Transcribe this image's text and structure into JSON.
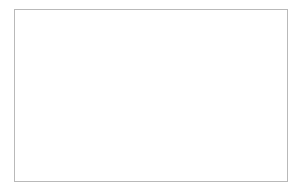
{
  "figure": {
    "kind": "stratigraphic-cross-section",
    "background_color": "#ffffff",
    "frame": {
      "name": "section-frame",
      "stroke_color": "#b9b9b9",
      "stroke_width": 1,
      "x": 14,
      "y": 9,
      "width": 274,
      "height": 173
    }
  },
  "chart_data": {
    "type": "line",
    "subtitle": "Folded strata beneath an erosional surface",
    "xlabel": "",
    "ylabel": "",
    "xlim": [
      14,
      288
    ],
    "ylim": [
      9,
      182
    ],
    "grid": false,
    "legend": null,
    "annotations": [],
    "series": [
      {
        "name": "erosional-top-surface",
        "role": "unconformity",
        "stroke_color": "#111111",
        "stroke_width": 2.6,
        "points": [
          [
            14,
            19
          ],
          [
            34,
            18.4
          ],
          [
            56,
            18.2
          ],
          [
            78,
            19.0
          ],
          [
            96,
            20.4
          ],
          [
            112,
            22.6
          ],
          [
            126,
            25.4
          ],
          [
            140,
            28.2
          ],
          [
            152,
            30.4
          ],
          [
            162,
            31.6
          ],
          [
            172,
            31.9
          ],
          [
            182,
            31.2
          ],
          [
            194,
            29.4
          ],
          [
            208,
            26.8
          ],
          [
            222,
            24.2
          ],
          [
            238,
            21.8
          ],
          [
            254,
            20.2
          ],
          [
            270,
            19.4
          ],
          [
            288,
            19.2
          ]
        ]
      },
      {
        "name": "hatched-unit-base",
        "role": "formation-contact",
        "stroke_color": "#1a1a1a",
        "stroke_width": 1.9,
        "points": [
          [
            14,
            78
          ],
          [
            34,
            77.4
          ],
          [
            54,
            76.6
          ],
          [
            74,
            76.2
          ],
          [
            92,
            77.4
          ],
          [
            108,
            80.2
          ],
          [
            124,
            83.8
          ],
          [
            140,
            87.6
          ],
          [
            154,
            90.6
          ],
          [
            166,
            92.2
          ],
          [
            178,
            92.4
          ],
          [
            192,
            91.2
          ],
          [
            208,
            88.4
          ],
          [
            224,
            84.6
          ],
          [
            240,
            80.6
          ],
          [
            256,
            77.2
          ],
          [
            272,
            74.8
          ],
          [
            288,
            73.6
          ]
        ]
      },
      {
        "name": "bedding-line-1",
        "role": "bedding-plane",
        "stroke_color": "#2a2a2a",
        "stroke_width": 1.4,
        "points": [
          [
            14,
            84
          ],
          [
            34,
            83.6
          ],
          [
            54,
            83.2
          ],
          [
            74,
            83.4
          ],
          [
            92,
            85.0
          ],
          [
            108,
            88.0
          ],
          [
            124,
            91.8
          ],
          [
            140,
            95.6
          ],
          [
            154,
            98.4
          ],
          [
            166,
            99.8
          ],
          [
            178,
            100.0
          ],
          [
            192,
            98.8
          ],
          [
            208,
            96.0
          ],
          [
            224,
            92.2
          ],
          [
            240,
            88.2
          ],
          [
            256,
            85.0
          ],
          [
            272,
            82.8
          ],
          [
            288,
            81.8
          ]
        ]
      },
      {
        "name": "bedding-line-2",
        "role": "bedding-plane",
        "stroke_color": "#2a2a2a",
        "stroke_width": 1.4,
        "points": [
          [
            14,
            90
          ],
          [
            34,
            89.6
          ],
          [
            54,
            89.4
          ],
          [
            74,
            89.8
          ],
          [
            92,
            91.6
          ],
          [
            108,
            94.8
          ],
          [
            124,
            98.6
          ],
          [
            140,
            102.4
          ],
          [
            154,
            105.2
          ],
          [
            166,
            106.6
          ],
          [
            178,
            106.8
          ],
          [
            192,
            105.6
          ],
          [
            208,
            102.8
          ],
          [
            224,
            99.0
          ],
          [
            240,
            95.0
          ],
          [
            256,
            91.8
          ],
          [
            272,
            89.6
          ],
          [
            288,
            88.6
          ]
        ]
      },
      {
        "name": "bedding-line-3",
        "role": "bedding-plane",
        "stroke_color": "#2a2a2a",
        "stroke_width": 1.4,
        "points": [
          [
            14,
            96
          ],
          [
            34,
            95.8
          ],
          [
            54,
            95.8
          ],
          [
            74,
            96.6
          ],
          [
            92,
            98.8
          ],
          [
            108,
            102.4
          ],
          [
            124,
            106.6
          ],
          [
            140,
            110.6
          ],
          [
            154,
            113.4
          ],
          [
            166,
            114.8
          ],
          [
            178,
            115.0
          ],
          [
            192,
            113.8
          ],
          [
            208,
            111.0
          ],
          [
            224,
            107.0
          ],
          [
            240,
            102.8
          ],
          [
            256,
            99.2
          ],
          [
            272,
            96.8
          ],
          [
            288,
            95.6
          ]
        ]
      },
      {
        "name": "bedding-line-4",
        "role": "bedding-plane",
        "stroke_color": "#2a2a2a",
        "stroke_width": 1.4,
        "points": [
          [
            14,
            136
          ],
          [
            34,
            136.6
          ],
          [
            54,
            137.6
          ],
          [
            74,
            139.4
          ],
          [
            92,
            142.2
          ],
          [
            108,
            145.6
          ],
          [
            124,
            149.2
          ],
          [
            140,
            152.4
          ],
          [
            154,
            154.6
          ],
          [
            166,
            155.6
          ],
          [
            178,
            155.6
          ],
          [
            192,
            154.4
          ],
          [
            208,
            152.0
          ],
          [
            224,
            148.8
          ],
          [
            240,
            145.4
          ],
          [
            256,
            142.6
          ],
          [
            272,
            140.6
          ],
          [
            288,
            139.6
          ]
        ]
      },
      {
        "name": "bedding-line-5",
        "role": "bedding-plane",
        "stroke_color": "#2a2a2a",
        "stroke_width": 1.4,
        "points": [
          [
            14,
            141
          ],
          [
            34,
            141.8
          ],
          [
            54,
            143.0
          ],
          [
            74,
            145.0
          ],
          [
            92,
            148.0
          ],
          [
            108,
            151.6
          ],
          [
            124,
            155.2
          ],
          [
            140,
            158.4
          ],
          [
            154,
            160.6
          ],
          [
            166,
            161.6
          ],
          [
            178,
            161.6
          ],
          [
            192,
            160.4
          ],
          [
            208,
            158.0
          ],
          [
            224,
            154.8
          ],
          [
            240,
            151.4
          ],
          [
            256,
            148.6
          ],
          [
            272,
            146.6
          ],
          [
            288,
            145.6
          ]
        ]
      }
    ],
    "layers": [
      {
        "name": "hatched-surface-unit",
        "fill_color": "#d9d9d9",
        "pattern": "stipple-with-vertical-hatch",
        "hatch_color": "#2b2b2b",
        "hatch_spacing_px": 5,
        "hatch_count": 53,
        "description": "Stippled grey unit with closely spaced near-vertical hatch lines, truncated above by an irregular toothed erosional surface"
      },
      {
        "name": "lower-white-unit",
        "fill_color": "#ffffff",
        "pattern": "none",
        "description": "Unshaded strata cut by thin folded bedding planes"
      }
    ],
    "fold": {
      "style": "syncline",
      "hinge_x": 172,
      "limb_dip_left": "gentle-east",
      "limb_dip_right": "gentle-west"
    }
  }
}
